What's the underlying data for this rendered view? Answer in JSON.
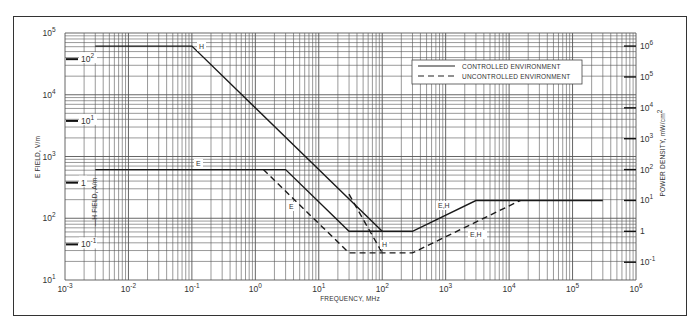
{
  "chart_data": {
    "type": "line",
    "title": "",
    "xlabel": "FREQUENCY, MHz",
    "ylabel": "E FIELD, V/m",
    "ylabel_inner": "H FIELD, A/m",
    "ylabel_right": "POWER DENSITY, mW/cm",
    "ylabel_right_sup": "2",
    "x_scale": "log",
    "y_scale": "log",
    "xlim": [
      0.001,
      1000000
    ],
    "ylim": [
      10,
      100000
    ],
    "grid": true,
    "x_ticks": [
      {
        "base": "10",
        "exp": "-3",
        "value": 0.001
      },
      {
        "base": "10",
        "exp": "-2",
        "value": 0.01
      },
      {
        "base": "10",
        "exp": "-1",
        "value": 0.1
      },
      {
        "base": "10",
        "exp": "0",
        "value": 1
      },
      {
        "base": "10",
        "exp": "1",
        "value": 10
      },
      {
        "base": "10",
        "exp": "2",
        "value": 100
      },
      {
        "base": "10",
        "exp": "3",
        "value": 1000
      },
      {
        "base": "10",
        "exp": "4",
        "value": 10000
      },
      {
        "base": "10",
        "exp": "5",
        "value": 100000
      },
      {
        "base": "10",
        "exp": "6",
        "value": 1000000
      }
    ],
    "y_ticks_left": [
      {
        "base": "10",
        "exp": "1",
        "value": 10
      },
      {
        "base": "10",
        "exp": "2",
        "value": 100
      },
      {
        "base": "10",
        "exp": "3",
        "value": 1000
      },
      {
        "base": "10",
        "exp": "4",
        "value": 10000
      },
      {
        "base": "10",
        "exp": "5",
        "value": 100000
      }
    ],
    "y_ticks_h_field": [
      {
        "base": "10",
        "exp": "2",
        "value": 100,
        "e_equiv": 37700
      },
      {
        "base": "10",
        "exp": "1",
        "value": 10,
        "e_equiv": 3770
      },
      {
        "base": "1",
        "exp": "",
        "value": 1,
        "e_equiv": 377
      },
      {
        "base": "10",
        "exp": "-1",
        "value": 0.1,
        "e_equiv": 37.7
      }
    ],
    "y_ticks_right": [
      {
        "base": "10",
        "exp": "6",
        "value": 1000000,
        "e_equiv": 61400
      },
      {
        "base": "10",
        "exp": "5",
        "value": 100000,
        "e_equiv": 19416
      },
      {
        "base": "10",
        "exp": "4",
        "value": 10000,
        "e_equiv": 6140
      },
      {
        "base": "10",
        "exp": "3",
        "value": 1000,
        "e_equiv": 1942
      },
      {
        "base": "10",
        "exp": "2",
        "value": 100,
        "e_equiv": 614
      },
      {
        "base": "10",
        "exp": "1",
        "value": 10,
        "e_equiv": 194
      },
      {
        "base": "1",
        "exp": "",
        "value": 1,
        "e_equiv": 61.4
      },
      {
        "base": "10",
        "exp": "-1",
        "value": 0.1,
        "e_equiv": 19.4
      }
    ],
    "legend": {
      "position": "upper right",
      "entries": [
        {
          "label": "CONTROLLED ENVIRONMENT",
          "style": "solid"
        },
        {
          "label": "UNCONTROLLED ENVIRONMENT",
          "style": "dashed"
        }
      ]
    },
    "series": [
      {
        "name": "Controlled H",
        "style": "solid",
        "label": "H",
        "x": [
          0.003,
          0.1,
          100
        ],
        "y": [
          61400,
          61400,
          61.4
        ]
      },
      {
        "name": "Controlled E",
        "style": "solid",
        "label": "E",
        "x": [
          0.003,
          3,
          30,
          300,
          3000,
          300000
        ],
        "y": [
          614,
          614,
          61.4,
          61.4,
          194,
          194
        ]
      },
      {
        "name": "Uncontrolled E",
        "style": "dashed",
        "label": "E",
        "x": [
          1.34,
          30,
          300,
          15000
        ],
        "y": [
          614,
          27.5,
          27.5,
          194
        ]
      },
      {
        "name": "Uncontrolled H",
        "style": "dashed",
        "label": "H",
        "x": [
          30,
          100
        ],
        "y": [
          245,
          27.5
        ]
      }
    ],
    "annotations": [
      {
        "text": "H",
        "near": "controlled H knee at 0.1 MHz"
      },
      {
        "text": "E",
        "near": "controlled E flat segment"
      },
      {
        "text": "E",
        "near": "uncontrolled E slope"
      },
      {
        "text": "H",
        "near": "uncontrolled H at 100 MHz"
      },
      {
        "text": "E,H",
        "near": "controlled rising segment"
      },
      {
        "text": "E,H",
        "near": "uncontrolled rising segment"
      }
    ]
  },
  "labels": {
    "x_axis": "FREQUENCY, MHz",
    "y_left": "E FIELD, V/m",
    "y_inner": "H FIELD, A/m",
    "y_right": "POWER DENSITY, mW/cm",
    "y_right_sup": "2",
    "legend_controlled": "CONTROLLED ENVIRONMENT",
    "legend_uncontrolled": "UNCONTROLLED ENVIRONMENT",
    "curve_h_controlled": "H",
    "curve_e_controlled": "E",
    "curve_e_uncontrolled": "E",
    "curve_h_uncontrolled": "H",
    "curve_eh_controlled": "E,H",
    "curve_eh_uncontrolled": "E,H"
  }
}
